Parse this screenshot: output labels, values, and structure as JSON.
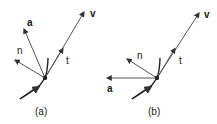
{
  "colors": {
    "vector": "#555555",
    "curve": "#222222",
    "text": "#1a1a1a"
  },
  "panels": [
    {
      "caption": "(a)",
      "labels": {
        "v": "v",
        "a": "a",
        "n": "n",
        "t": "t"
      },
      "description": "acceleration a points up-left, between n and v"
    },
    {
      "caption": "(b)",
      "labels": {
        "v": "v",
        "a": "a",
        "n": "n",
        "t": "t"
      },
      "description": "acceleration a points horizontally left"
    }
  ]
}
